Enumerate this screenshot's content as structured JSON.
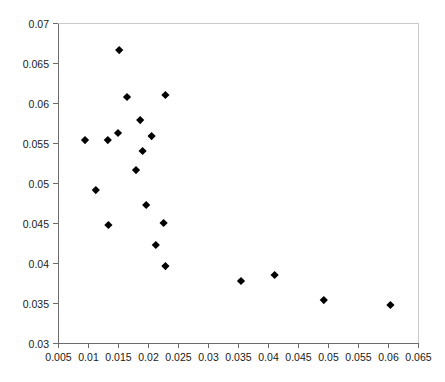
{
  "chart_data": {
    "type": "scatter",
    "title": "",
    "subtitle": "",
    "xlabel": "",
    "ylabel": "",
    "xlim": [
      0.005,
      0.065
    ],
    "ylim": [
      0.03,
      0.07
    ],
    "xticks": [
      0.005,
      0.01,
      0.015,
      0.02,
      0.025,
      0.03,
      0.035,
      0.04,
      0.045,
      0.05,
      0.055,
      0.06,
      0.065
    ],
    "yticks": [
      0.03,
      0.035,
      0.04,
      0.045,
      0.05,
      0.055,
      0.06,
      0.065,
      0.07
    ],
    "xtick_labels": [
      "0.005",
      "0.01",
      "0.015",
      "0.02",
      "0.025",
      "0.03",
      "0.035",
      "0.04",
      "0.045",
      "0.05",
      "0.055",
      "0.06",
      "0.065"
    ],
    "ytick_labels": [
      "0.03",
      "0.035",
      "0.04",
      "0.045",
      "0.05",
      "0.055",
      "0.06",
      "0.065",
      "0.07"
    ],
    "grid": false,
    "legend": null,
    "marker": "diamond",
    "marker_color": "#000000",
    "series": [
      {
        "name": "series-1",
        "points": [
          [
            0.0095,
            0.05537
          ],
          [
            0.0113,
            0.04912
          ],
          [
            0.0133,
            0.05537
          ],
          [
            0.0134,
            0.04475
          ],
          [
            0.015,
            0.05625
          ],
          [
            0.0152,
            0.06662
          ],
          [
            0.0165,
            0.06075
          ],
          [
            0.018,
            0.05162
          ],
          [
            0.0187,
            0.05787
          ],
          [
            0.0191,
            0.054
          ],
          [
            0.0197,
            0.04725
          ],
          [
            0.0206,
            0.05587
          ],
          [
            0.0213,
            0.04225
          ],
          [
            0.0226,
            0.045
          ],
          [
            0.0229,
            0.061
          ],
          [
            0.0229,
            0.03962
          ],
          [
            0.0355,
            0.03775
          ],
          [
            0.0411,
            0.0385
          ],
          [
            0.0493,
            0.03537
          ],
          [
            0.0604,
            0.03475
          ]
        ]
      }
    ]
  },
  "plot_geometry": {
    "left": 58,
    "right": 418,
    "top": 23,
    "bottom": 343
  }
}
